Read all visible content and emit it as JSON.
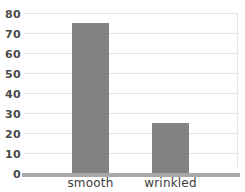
{
  "chart_data": {
    "type": "bar",
    "title": "",
    "subtitle": "",
    "xlabel": "",
    "ylabel": "",
    "categories": [
      "smooth",
      "wrinkled"
    ],
    "values": [
      75,
      25
    ],
    "series": [
      {
        "name": "count",
        "values": [
          75,
          25
        ]
      }
    ],
    "ylim": [
      0,
      80
    ],
    "ytick_values": [
      0,
      10,
      20,
      30,
      40,
      50,
      60,
      70,
      80
    ],
    "ytick_labels": [
      "0",
      "10",
      "20",
      "30",
      "40",
      "50",
      "60",
      "70",
      "80"
    ],
    "grid": true,
    "grid_axis": "y",
    "legend": false,
    "legend_position": "none",
    "bar_color": "#828282",
    "grid_color": "#e3e3e3",
    "axis_color": "#a8a8a8",
    "tick_label_color": "#4a4a4a",
    "category_label_color": "#3c3c3c",
    "background_color": "#ffffff"
  }
}
